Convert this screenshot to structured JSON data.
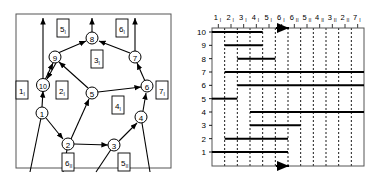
{
  "figure": {
    "panels": [
      "left-graph-panel",
      "right-barcode-panel"
    ]
  },
  "left_panel": {
    "name": "directed-graph-with-face-labels",
    "vertices": [
      {
        "id": "v1",
        "label": "1",
        "x": 42,
        "y": 113
      },
      {
        "id": "v2",
        "label": "2",
        "x": 68,
        "y": 144
      },
      {
        "id": "v3",
        "label": "3",
        "x": 114,
        "y": 145
      },
      {
        "id": "v4",
        "label": "4",
        "x": 141,
        "y": 117
      },
      {
        "id": "v5",
        "label": "5",
        "x": 92,
        "y": 93
      },
      {
        "id": "v6",
        "label": "6",
        "x": 147,
        "y": 86
      },
      {
        "id": "v7",
        "label": "7",
        "x": 135,
        "y": 57
      },
      {
        "id": "v8",
        "label": "8",
        "x": 92,
        "y": 38
      },
      {
        "id": "v9",
        "label": "9",
        "x": 55,
        "y": 57
      },
      {
        "id": "v10",
        "label": "10",
        "x": 43,
        "y": 85
      }
    ],
    "edges": [
      {
        "from": "v9",
        "to": "v8"
      },
      {
        "from": "v7",
        "to": "v8"
      },
      {
        "from": "v5",
        "to": "v9"
      },
      {
        "from": "v10",
        "to": "v9"
      },
      {
        "from": "v9",
        "to": "v10"
      },
      {
        "from": "v1",
        "to": "v10"
      },
      {
        "from": "v5",
        "to": "v6"
      },
      {
        "from": "v6",
        "to": "v7"
      },
      {
        "from": "v2",
        "to": "v5"
      },
      {
        "from": "v1",
        "to": "v2"
      },
      {
        "from": "v2",
        "to": "v3"
      },
      {
        "from": "v3",
        "to": "v4"
      },
      {
        "from": "v4",
        "to": "v6"
      }
    ],
    "face_labels": [
      {
        "id": "f1",
        "num": "1",
        "sub": "I",
        "x": 22,
        "y": 90
      },
      {
        "id": "f2",
        "num": "2",
        "sub": "I",
        "x": 62,
        "y": 90
      },
      {
        "id": "f3",
        "num": "3",
        "sub": "I",
        "x": 97,
        "y": 59
      },
      {
        "id": "f4",
        "num": "4",
        "sub": "I",
        "x": 118,
        "y": 105
      },
      {
        "id": "f5a",
        "num": "5",
        "sub": "I",
        "x": 63,
        "y": 28
      },
      {
        "id": "f6a",
        "num": "6",
        "sub": "I",
        "x": 122,
        "y": 28
      },
      {
        "id": "f7",
        "num": "7",
        "sub": "I",
        "x": 162,
        "y": 90
      },
      {
        "id": "f6b",
        "num": "6",
        "sub": "II",
        "x": 68,
        "y": 162
      },
      {
        "id": "f5b",
        "num": "5",
        "sub": "II",
        "x": 124,
        "y": 162
      }
    ]
  },
  "right_panel": {
    "name": "persistence-barcode-chart"
  },
  "chart_data": {
    "type": "bar",
    "orientation": "horizontal",
    "title": "",
    "xlabel": "",
    "ylabel": "",
    "grid": true,
    "legend": false,
    "categories": [
      "1",
      "2",
      "3",
      "4",
      "5",
      "6",
      "7",
      "8",
      "9",
      "10"
    ],
    "ylim": [
      1,
      10
    ],
    "x_tick_labels": [
      {
        "num": "1",
        "sub": "I"
      },
      {
        "num": "2",
        "sub": "I"
      },
      {
        "num": "3",
        "sub": "I"
      },
      {
        "num": "4",
        "sub": "I"
      },
      {
        "num": "5",
        "sub": "I"
      },
      {
        "num": "6",
        "sub": "I"
      },
      {
        "num": "6",
        "sub": "II"
      },
      {
        "num": "5",
        "sub": "II"
      },
      {
        "num": "4",
        "sub": "II"
      },
      {
        "num": "3",
        "sub": "II"
      },
      {
        "num": "2",
        "sub": "II"
      },
      {
        "num": "7",
        "sub": "I"
      }
    ],
    "bars": [
      {
        "row": "10",
        "start": 0,
        "end": 4
      },
      {
        "row": "9",
        "start": 1,
        "end": 4
      },
      {
        "row": "8",
        "start": 2,
        "end": 5
      },
      {
        "row": "7",
        "start": 1,
        "end": 12
      },
      {
        "row": "6",
        "start": 2,
        "end": 12
      },
      {
        "row": "5",
        "start": 0,
        "end": 2
      },
      {
        "row": "4",
        "start": 3,
        "end": 12
      },
      {
        "row": "3",
        "start": 3,
        "end": 7
      },
      {
        "row": "2",
        "start": 1,
        "end": 6
      },
      {
        "row": "1",
        "start": 0,
        "end": 6
      }
    ],
    "arrow_column_index": 6
  }
}
